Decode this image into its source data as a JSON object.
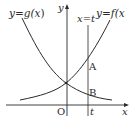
{
  "diagram": {
    "curves": {
      "g": {
        "label": "y = g(x)",
        "label_parts": [
          "y",
          "=",
          "g(",
          "x",
          ")"
        ]
      },
      "f": {
        "label": "y = f(x",
        "label_parts": [
          "y",
          "=",
          "f(",
          "x"
        ]
      }
    },
    "vertical_line": {
      "label": "x = t",
      "label_parts": [
        "x",
        "=",
        "t"
      ]
    },
    "axes": {
      "x_label": "x",
      "y_label": "y",
      "origin_label": "O",
      "t_tick_label": "t"
    },
    "points": {
      "A": "A",
      "B": "B"
    },
    "colors": {
      "stroke": "#2a2a2a",
      "background": "#ffffff"
    }
  }
}
